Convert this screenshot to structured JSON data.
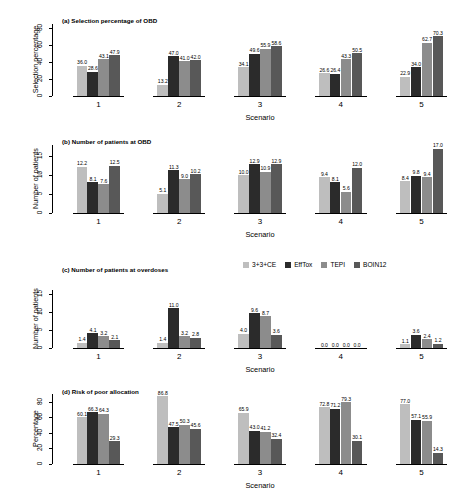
{
  "legend": {
    "position": "top-right-of-panel-c",
    "items": [
      {
        "label": "3+3+CE",
        "color": "#bebebe"
      },
      {
        "label": "EffTox",
        "color": "#2b2b2b"
      },
      {
        "label": "TEPI",
        "color": "#8c8c8c"
      },
      {
        "label": "BOIN12",
        "color": "#585858"
      }
    ]
  },
  "chart_data": [
    {
      "type": "bar",
      "panel": "a",
      "title": "(a) Selection percentage of OBD",
      "xlabel": "Scenario",
      "ylabel": "Selection percentage",
      "categories": [
        "1",
        "2",
        "3",
        "4",
        "5"
      ],
      "yticks": [
        "0",
        "20",
        "40",
        "60",
        "80"
      ],
      "ylim": [
        0,
        85
      ],
      "grid": false,
      "series": [
        {
          "name": "3+3+CE",
          "color": "#bebebe",
          "values": [
            36.0,
            13.2,
            34.1,
            26.6,
            22.9
          ]
        },
        {
          "name": "EffTox",
          "color": "#2b2b2b",
          "values": [
            28.6,
            47.0,
            49.6,
            26.4,
            34.0
          ]
        },
        {
          "name": "TEPI",
          "color": "#8c8c8c",
          "values": [
            43.1,
            41.0,
            55.9,
            43.3,
            62.7
          ]
        },
        {
          "name": "BOIN12",
          "color": "#585858",
          "values": [
            47.9,
            42.0,
            58.6,
            50.5,
            70.3
          ]
        }
      ]
    },
    {
      "type": "bar",
      "panel": "b",
      "title": "(b) Number of patients at OBD",
      "xlabel": "Scenario",
      "ylabel": "Number of patients",
      "categories": [
        "1",
        "2",
        "3",
        "4",
        "5"
      ],
      "yticks": [
        "0",
        "5",
        "10",
        "15"
      ],
      "ylim": [
        0,
        18
      ],
      "grid": false,
      "series": [
        {
          "name": "3+3+CE",
          "color": "#bebebe",
          "values": [
            12.2,
            5.1,
            10.0,
            9.4,
            8.4
          ]
        },
        {
          "name": "EffTox",
          "color": "#2b2b2b",
          "values": [
            8.1,
            11.3,
            12.9,
            8.1,
            9.8
          ]
        },
        {
          "name": "TEPI",
          "color": "#8c8c8c",
          "values": [
            7.6,
            9.0,
            10.9,
            5.6,
            9.4
          ]
        },
        {
          "name": "BOIN12",
          "color": "#585858",
          "values": [
            12.5,
            10.2,
            12.9,
            12.0,
            17.0
          ]
        }
      ]
    },
    {
      "type": "bar",
      "panel": "c",
      "title": "(c) Number of patients at overdoses",
      "xlabel": "Scenario",
      "ylabel": "Number of patients",
      "categories": [
        "1",
        "2",
        "3",
        "4",
        "5"
      ],
      "yticks": [
        "0",
        "5",
        "10",
        "15"
      ],
      "ylim": [
        0,
        16
      ],
      "grid": false,
      "series": [
        {
          "name": "3+3+CE",
          "color": "#bebebe",
          "values": [
            1.4,
            1.4,
            4.0,
            0.0,
            1.1
          ]
        },
        {
          "name": "EffTox",
          "color": "#2b2b2b",
          "values": [
            4.1,
            11.0,
            9.6,
            0.0,
            3.6
          ]
        },
        {
          "name": "TEPI",
          "color": "#8c8c8c",
          "values": [
            3.2,
            3.2,
            8.7,
            0.0,
            2.4
          ]
        },
        {
          "name": "BOIN12",
          "color": "#585858",
          "values": [
            2.1,
            2.8,
            3.6,
            0.0,
            1.2
          ]
        }
      ]
    },
    {
      "type": "bar",
      "panel": "d",
      "title": "(d) Risk of poor allocation",
      "xlabel": "Scenario",
      "ylabel": "Percentage",
      "categories": [
        "1",
        "2",
        "3",
        "4",
        "5"
      ],
      "yticks": [
        "0",
        "20",
        "40",
        "60",
        "80"
      ],
      "ylim": [
        0,
        90
      ],
      "grid": false,
      "series": [
        {
          "name": "3+3+CE",
          "color": "#bebebe",
          "values": [
            60.1,
            86.8,
            65.9,
            72.8,
            77.0
          ]
        },
        {
          "name": "EffTox",
          "color": "#2b2b2b",
          "values": [
            66.3,
            47.5,
            43.0,
            71.2,
            57.1
          ]
        },
        {
          "name": "TEPI",
          "color": "#8c8c8c",
          "values": [
            64.3,
            50.3,
            41.2,
            79.3,
            55.9
          ]
        },
        {
          "name": "BOIN12",
          "color": "#585858",
          "values": [
            29.3,
            45.6,
            32.4,
            30.1,
            14.3
          ]
        }
      ]
    }
  ]
}
